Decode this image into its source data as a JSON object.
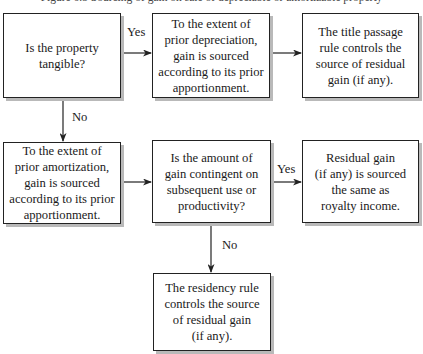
{
  "header": {
    "cut_off_text": "Figure 6.3  Sourcing of gain on sale of depreciable or amortizable property"
  },
  "nodes": [
    {
      "id": "q1",
      "type": "decision",
      "text": "Is the property\ntangible?"
    },
    {
      "id": "a1",
      "type": "process",
      "text": "To the extent of\nprior depreciation,\ngain is sourced\naccording to its prior\napportionment."
    },
    {
      "id": "r1",
      "type": "result",
      "text": "The title passage\nrule controls the\nsource of residual\ngain (if any)."
    },
    {
      "id": "a2",
      "type": "process",
      "text": "To the extent of\nprior amortization,\ngain is sourced\naccording to its prior\napportionment."
    },
    {
      "id": "q2",
      "type": "decision",
      "text": "Is the amount of\ngain contingent on\nsubsequent use or\nproductivity?"
    },
    {
      "id": "r2",
      "type": "result",
      "text": "Residual gain\n(if any) is sourced\nthe same as\nroyalty income."
    },
    {
      "id": "r3",
      "type": "result",
      "text": "The residency rule\ncontrols the source\nof residual gain\n(if any)."
    }
  ],
  "edges": [
    {
      "from": "q1",
      "to": "a1",
      "label": "Yes"
    },
    {
      "from": "a1",
      "to": "r1",
      "label": ""
    },
    {
      "from": "q1",
      "to": "a2",
      "label": "No"
    },
    {
      "from": "a2",
      "to": "q2",
      "label": ""
    },
    {
      "from": "q2",
      "to": "r2",
      "label": "Yes"
    },
    {
      "from": "q2",
      "to": "r3",
      "label": "No"
    }
  ],
  "colors": {
    "line": "#222222",
    "shadow": "#b9b9b9",
    "background": "#ffffff"
  }
}
